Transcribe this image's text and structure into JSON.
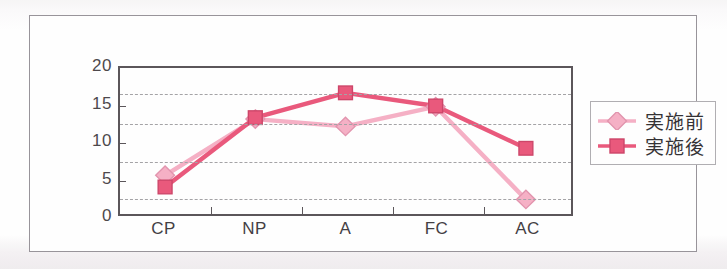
{
  "figure": {
    "frame_border_color": "#8e8a90",
    "background_color": "#ffffff"
  },
  "legend": {
    "position": "right",
    "entries": [
      {
        "label": "実施前",
        "color": "#f5a9c0",
        "marker": "diamond"
      },
      {
        "label": "実施後",
        "color": "#e8486f",
        "marker": "square"
      }
    ]
  },
  "chart_data": {
    "type": "line",
    "title": "",
    "subtitle": "",
    "xlabel": "",
    "ylabel": "",
    "categories": [
      "CP",
      "NP",
      "A",
      "FC",
      "AC"
    ],
    "ylim": [
      0,
      20
    ],
    "yticks": [
      0,
      5,
      10,
      15,
      20
    ],
    "ytick_labels": [
      "0",
      "5",
      "10",
      "15",
      "20"
    ],
    "gridlines": [
      2.5,
      7.5,
      12.5,
      16.5
    ],
    "grid": true,
    "grid_style": "dashed",
    "series": [
      {
        "name": "実施前",
        "color": "#f5a9c0",
        "marker": "diamond",
        "values": [
          5.3,
          13.0,
          12.0,
          14.7,
          2.0
        ]
      },
      {
        "name": "実施後",
        "color": "#e8486f",
        "marker": "square",
        "values": [
          3.7,
          13.2,
          16.6,
          14.8,
          9.0
        ]
      }
    ]
  }
}
